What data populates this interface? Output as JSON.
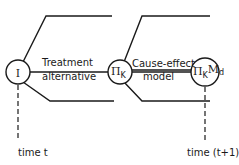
{
  "diagram": {
    "nodes": [
      {
        "id": "n1",
        "label": "I"
      },
      {
        "id": "n2",
        "label": "Π",
        "subscript": "K"
      },
      {
        "id": "n3",
        "label": "Π",
        "subscript": "K",
        "label2": "M",
        "subscript2": "d"
      }
    ],
    "edges": [
      {
        "from": "n1",
        "to": "n2",
        "label_line1": "Treatment",
        "label_line2": "alternative"
      },
      {
        "from": "n2",
        "to": "n3",
        "label_line1": "Cause-effect",
        "label_line2": "model"
      }
    ],
    "timelines": [
      {
        "node": "n1",
        "label": "time t"
      },
      {
        "node": "n3",
        "label": "time (t+1)"
      }
    ]
  }
}
